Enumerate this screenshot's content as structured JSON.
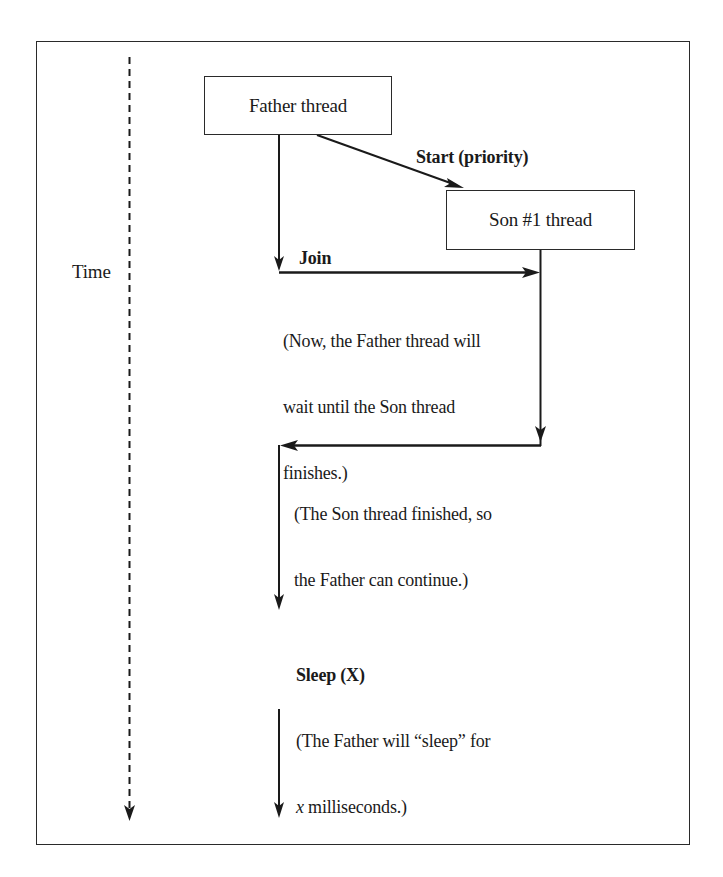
{
  "diagram": {
    "type": "thread-timeline",
    "time_axis": {
      "label": "Time",
      "style": "dashed",
      "direction": "down"
    },
    "nodes": [
      {
        "id": "father",
        "label": "Father thread"
      },
      {
        "id": "son1",
        "label": "Son #1 thread"
      }
    ],
    "edges": [
      {
        "from": "father",
        "to": "son1",
        "label": "Start (priority)",
        "style": "solid-arrow"
      },
      {
        "from": "father",
        "to": "son1",
        "label": "Join",
        "style": "solid-arrow"
      },
      {
        "from": "son1",
        "to": "father",
        "label": "",
        "style": "solid-arrow"
      }
    ],
    "annotations": {
      "start": "Start (priority)",
      "join": "Join",
      "join_note": [
        "(Now, the Father thread will",
        "wait until the Son thread",
        "finishes.)"
      ],
      "return_note": [
        "(The Son thread finished, so",
        "the Father can continue.)"
      ],
      "sleep": "Sleep (X)",
      "sleep_note_line1": "(The Father will “sleep” for",
      "sleep_note_line2_var": "x",
      "sleep_note_line2_rest": " milliseconds.)"
    }
  },
  "colors": {
    "stroke": "#1a1a1a",
    "background": "#ffffff"
  }
}
